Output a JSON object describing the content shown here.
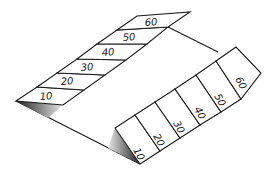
{
  "figure": {
    "left_strip": {
      "labels": [
        "10",
        "20",
        "30",
        "40",
        "50",
        "60"
      ]
    },
    "right_strip": {
      "labels": [
        "10",
        "20",
        "30",
        "40",
        "50",
        "60"
      ]
    },
    "colors": {
      "line": "#1a1a1a",
      "paper": "#ffffff",
      "shade_dark": "#2a2a2a",
      "shade_light": "#dddddd"
    }
  }
}
